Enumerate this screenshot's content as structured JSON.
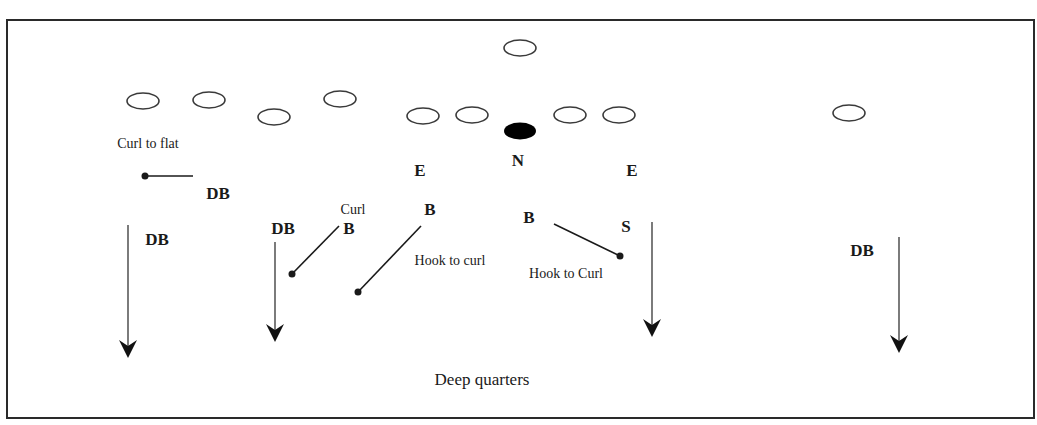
{
  "diagram": {
    "kind": "football-defensive-coverage",
    "colors": {
      "ink": "#1a1a1a",
      "background": "#ffffff",
      "frame": "#2a2a2a"
    },
    "frame": {
      "x": 7,
      "y": 20,
      "w": 1027,
      "h": 398
    },
    "offense": [
      {
        "cx": 143,
        "cy": 101
      },
      {
        "cx": 209,
        "cy": 100
      },
      {
        "cx": 274,
        "cy": 117
      },
      {
        "cx": 340,
        "cy": 99
      },
      {
        "cx": 423,
        "cy": 116
      },
      {
        "cx": 472,
        "cy": 115
      },
      {
        "cx": 520,
        "cy": 48
      },
      {
        "cx": 570,
        "cy": 115
      },
      {
        "cx": 619,
        "cy": 115
      },
      {
        "cx": 849,
        "cy": 113
      }
    ],
    "ball": {
      "cx": 520,
      "cy": 131,
      "label": "center-ball"
    },
    "defenders": [
      {
        "id": "db-left-flat",
        "label": "DB",
        "x": 218,
        "y": 199
      },
      {
        "id": "end-left",
        "label": "E",
        "x": 420,
        "y": 176
      },
      {
        "id": "nose",
        "label": "N",
        "x": 518,
        "y": 166
      },
      {
        "id": "end-right",
        "label": "E",
        "x": 632,
        "y": 176
      },
      {
        "id": "backer-left",
        "label": "B",
        "x": 430,
        "y": 215
      },
      {
        "id": "backer-mid",
        "label": "B",
        "x": 529,
        "y": 223
      },
      {
        "id": "safety",
        "label": "S",
        "x": 626,
        "y": 232
      },
      {
        "id": "backer-curl",
        "label": "B",
        "x": 349,
        "y": 234
      },
      {
        "id": "db-left-deep",
        "label": "DB",
        "x": 157,
        "y": 245
      },
      {
        "id": "db-left-mid",
        "label": "DB",
        "x": 283,
        "y": 234
      },
      {
        "id": "db-right-deep",
        "label": "DB",
        "x": 862,
        "y": 256
      }
    ],
    "annotations": [
      {
        "id": "curl-to-flat",
        "text": "Curl to flat",
        "x": 148,
        "y": 148,
        "size": "note"
      },
      {
        "id": "curl",
        "text": "Curl",
        "x": 353,
        "y": 214,
        "size": "note"
      },
      {
        "id": "hook-to-curl-left",
        "text": "Hook to curl",
        "x": 450,
        "y": 265,
        "size": "note"
      },
      {
        "id": "hook-to-curl-right",
        "text": "Hook to Curl",
        "x": 566,
        "y": 278,
        "size": "note"
      },
      {
        "id": "deep-quarters",
        "text": "Deep quarters",
        "x": 482,
        "y": 385,
        "size": "note-lg"
      }
    ],
    "zone_drops": [
      {
        "id": "drop-curl-to-flat",
        "x1": 193,
        "y1": 176,
        "x2": 145,
        "y2": 176
      },
      {
        "id": "drop-curl",
        "x1": 339,
        "y1": 226,
        "x2": 292,
        "y2": 274
      },
      {
        "id": "drop-hook-left",
        "x1": 421,
        "y1": 226,
        "x2": 358,
        "y2": 292
      },
      {
        "id": "drop-hook-right",
        "x1": 554,
        "y1": 224,
        "x2": 620,
        "y2": 256
      }
    ],
    "deep_arrows": [
      {
        "id": "deep-arrow-1",
        "x": 128,
        "y1": 225,
        "y2": 358
      },
      {
        "id": "deep-arrow-2",
        "x": 275,
        "y1": 242,
        "y2": 342
      },
      {
        "id": "deep-arrow-3",
        "x": 652,
        "y1": 222,
        "y2": 337
      },
      {
        "id": "deep-arrow-4",
        "x": 899,
        "y1": 237,
        "y2": 353
      }
    ]
  }
}
